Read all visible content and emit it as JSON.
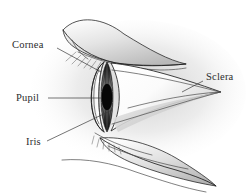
{
  "figure": {
    "background_color": "#ffffff",
    "ink_color": "#1f1f1f",
    "label_color": "#2c2c2c"
  },
  "labels": {
    "cornea": {
      "text": "Cornea",
      "x": 12,
      "y": 48,
      "anchor": "start"
    },
    "pupil": {
      "text": "Pupil",
      "x": 16,
      "y": 101,
      "anchor": "start"
    },
    "iris": {
      "text": "Iris",
      "x": 26,
      "y": 145,
      "anchor": "start"
    },
    "sclera": {
      "text": "Sclera",
      "x": 206,
      "y": 80,
      "anchor": "start"
    }
  },
  "parts": {
    "cornea": {
      "name": "cornea",
      "description": "transparent anterior dome",
      "fill_light": "#ffffff",
      "fill_shadow": "#d8d8d8"
    },
    "iris": {
      "name": "iris",
      "description": "dark radially striated ring behind cornea",
      "fill_dark": "#1a1a1a",
      "fill_mid": "#4e4e4e"
    },
    "pupil": {
      "name": "pupil",
      "description": "central black aperture",
      "fill": "#080808"
    },
    "sclera": {
      "name": "sclera",
      "description": "white of the eye tapering to posterior point",
      "fill_light": "#ffffff",
      "fill_shadow": "#c9c9c9"
    },
    "upper_eyelid": {
      "name": "upper-eyelid",
      "fill_light": "#f2f2f2",
      "fill_shadow": "#b4b4b4"
    },
    "lower_eyelid": {
      "name": "lower-eyelid",
      "fill_light": "#f4f4f4",
      "fill_shadow": "#b8b8b8"
    },
    "eyelashes": {
      "name": "eyelashes",
      "stroke": "#6a6a6a"
    }
  }
}
